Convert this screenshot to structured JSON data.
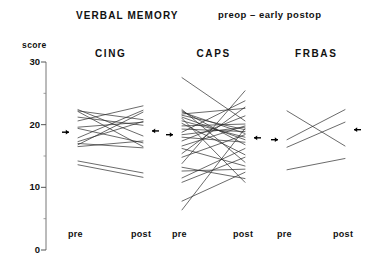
{
  "figure": {
    "title": "VERBAL  MEMORY",
    "subtitle": "preop  –  early postop",
    "score_axis_label": "score"
  },
  "axis": {
    "ticks_major": [
      "30",
      "20",
      "10",
      "0"
    ],
    "tick_values": [
      30,
      20,
      10,
      0
    ],
    "minor_tick_values": [
      25,
      15,
      5
    ]
  },
  "panels": [
    {
      "name": "CING",
      "x_labels": [
        "pre",
        "post"
      ]
    },
    {
      "name": "CAPS",
      "x_labels": [
        "pre",
        "post"
      ]
    },
    {
      "name": "FRBAS",
      "x_labels": [
        "pre",
        "post"
      ]
    }
  ],
  "chart_data": {
    "type": "line",
    "title": "VERBAL  MEMORY",
    "subtitle": "preop – early postop",
    "xlabel": "",
    "ylabel": "score",
    "ylim": [
      0,
      30
    ],
    "yticks": [
      0,
      10,
      20,
      30
    ],
    "yticks_minor": [
      5,
      15,
      25
    ],
    "grid": false,
    "legend": "none",
    "x": [
      "pre",
      "post"
    ],
    "groups": [
      {
        "name": "CING",
        "mean_pre": 18.8,
        "mean_post": 19.0,
        "series": [
          {
            "name": "CING-1",
            "values": [
              22.4,
              18.2
            ]
          },
          {
            "name": "CING-2",
            "values": [
              22.2,
              20.8
            ]
          },
          {
            "name": "CING-3",
            "values": [
              22.1,
              16.5
            ]
          },
          {
            "name": "CING-4",
            "values": [
              21.2,
              19.9
            ]
          },
          {
            "name": "CING-5",
            "values": [
              20.6,
              23.0
            ]
          },
          {
            "name": "CING-6",
            "values": [
              19.6,
              20.4
            ]
          },
          {
            "name": "CING-7",
            "values": [
              19.4,
              17.1
            ]
          },
          {
            "name": "CING-8",
            "values": [
              17.9,
              22.3
            ]
          },
          {
            "name": "CING-9",
            "values": [
              17.3,
              20.5
            ]
          },
          {
            "name": "CING-10",
            "values": [
              17.0,
              16.3
            ]
          },
          {
            "name": "CING-11",
            "values": [
              16.8,
              22.0
            ]
          },
          {
            "name": "CING-12",
            "values": [
              16.5,
              17.4
            ]
          },
          {
            "name": "CING-13",
            "values": [
              14.2,
              12.3
            ]
          },
          {
            "name": "CING-14",
            "values": [
              13.6,
              11.6
            ]
          }
        ]
      },
      {
        "name": "CAPS",
        "mean_pre": 18.4,
        "mean_post": 17.9,
        "series": [
          {
            "name": "CAPS-1",
            "values": [
              27.5,
              20.6
            ]
          },
          {
            "name": "CAPS-2",
            "values": [
              22.4,
              14.0
            ]
          },
          {
            "name": "CAPS-3",
            "values": [
              22.2,
              16.8
            ]
          },
          {
            "name": "CAPS-4",
            "values": [
              22.0,
              18.6
            ]
          },
          {
            "name": "CAPS-5",
            "values": [
              21.7,
              22.6
            ]
          },
          {
            "name": "CAPS-6",
            "values": [
              21.5,
              19.2
            ]
          },
          {
            "name": "CAPS-7",
            "values": [
              21.2,
              17.6
            ]
          },
          {
            "name": "CAPS-8",
            "values": [
              21.0,
              10.8
            ]
          },
          {
            "name": "CAPS-9",
            "values": [
              20.6,
              18.0
            ]
          },
          {
            "name": "CAPS-10",
            "values": [
              20.2,
              15.2
            ]
          },
          {
            "name": "CAPS-11",
            "values": [
              19.8,
              20.1
            ]
          },
          {
            "name": "CAPS-12",
            "values": [
              19.3,
              18.9
            ]
          },
          {
            "name": "CAPS-13",
            "values": [
              18.8,
              23.8
            ]
          },
          {
            "name": "CAPS-14",
            "values": [
              18.4,
              19.6
            ]
          },
          {
            "name": "CAPS-15",
            "values": [
              18.0,
              17.2
            ]
          },
          {
            "name": "CAPS-16",
            "values": [
              17.4,
              21.4
            ]
          },
          {
            "name": "CAPS-17",
            "values": [
              16.6,
              19.8
            ]
          },
          {
            "name": "CAPS-18",
            "values": [
              16.2,
              13.4
            ]
          },
          {
            "name": "CAPS-19",
            "values": [
              15.4,
              22.8
            ]
          },
          {
            "name": "CAPS-20",
            "values": [
              14.8,
              18.4
            ]
          },
          {
            "name": "CAPS-21",
            "values": [
              13.8,
              25.4
            ]
          },
          {
            "name": "CAPS-22",
            "values": [
              13.2,
              11.4
            ]
          },
          {
            "name": "CAPS-23",
            "values": [
              12.6,
              12.9
            ]
          },
          {
            "name": "CAPS-24",
            "values": [
              11.5,
              16.2
            ]
          },
          {
            "name": "CAPS-25",
            "values": [
              10.8,
              14.8
            ]
          },
          {
            "name": "CAPS-26",
            "values": [
              7.8,
              12.4
            ]
          },
          {
            "name": "CAPS-27",
            "values": [
              6.4,
              19.4
            ]
          }
        ]
      },
      {
        "name": "FRBAS",
        "mean_pre": 17.6,
        "mean_post": 19.2,
        "series": [
          {
            "name": "FRBAS-1",
            "values": [
              22.2,
              16.6
            ]
          },
          {
            "name": "FRBAS-2",
            "values": [
              17.6,
              22.4
            ]
          },
          {
            "name": "FRBAS-3",
            "values": [
              16.4,
              20.4
            ]
          },
          {
            "name": "FRBAS-4",
            "values": [
              12.8,
              14.6
            ]
          }
        ]
      }
    ]
  }
}
